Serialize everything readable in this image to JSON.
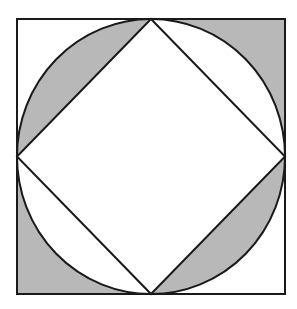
{
  "figure": {
    "colors": {
      "stroke": "#1a1a1a",
      "shade": "#b8b8b8",
      "background": "#ffffff"
    },
    "square": {
      "x1": 17,
      "y1": 19,
      "x2": 285,
      "y2": 294
    },
    "shaded_regions": [
      "top-left circular segment between arc and diamond edge",
      "top-right corner between square and circle",
      "bottom-left corner between square and circle",
      "bottom-right circular segment between arc and diamond edge"
    ]
  }
}
